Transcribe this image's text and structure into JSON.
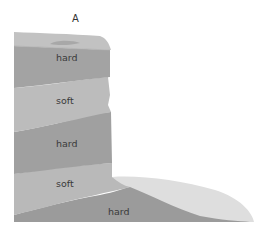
{
  "diagram": {
    "title": "A",
    "layers": [
      {
        "label": "hard",
        "type": "hard"
      },
      {
        "label": "soft",
        "type": "soft"
      },
      {
        "label": "hard",
        "type": "hard"
      },
      {
        "label": "soft",
        "type": "soft"
      },
      {
        "label": "hard",
        "type": "hard"
      }
    ],
    "colors": {
      "hard": "#9e9e9e",
      "soft": "#b8b8b8",
      "cap": "#c4c4c4",
      "scree": "#dcdcdc",
      "background": "#ffffff"
    }
  }
}
